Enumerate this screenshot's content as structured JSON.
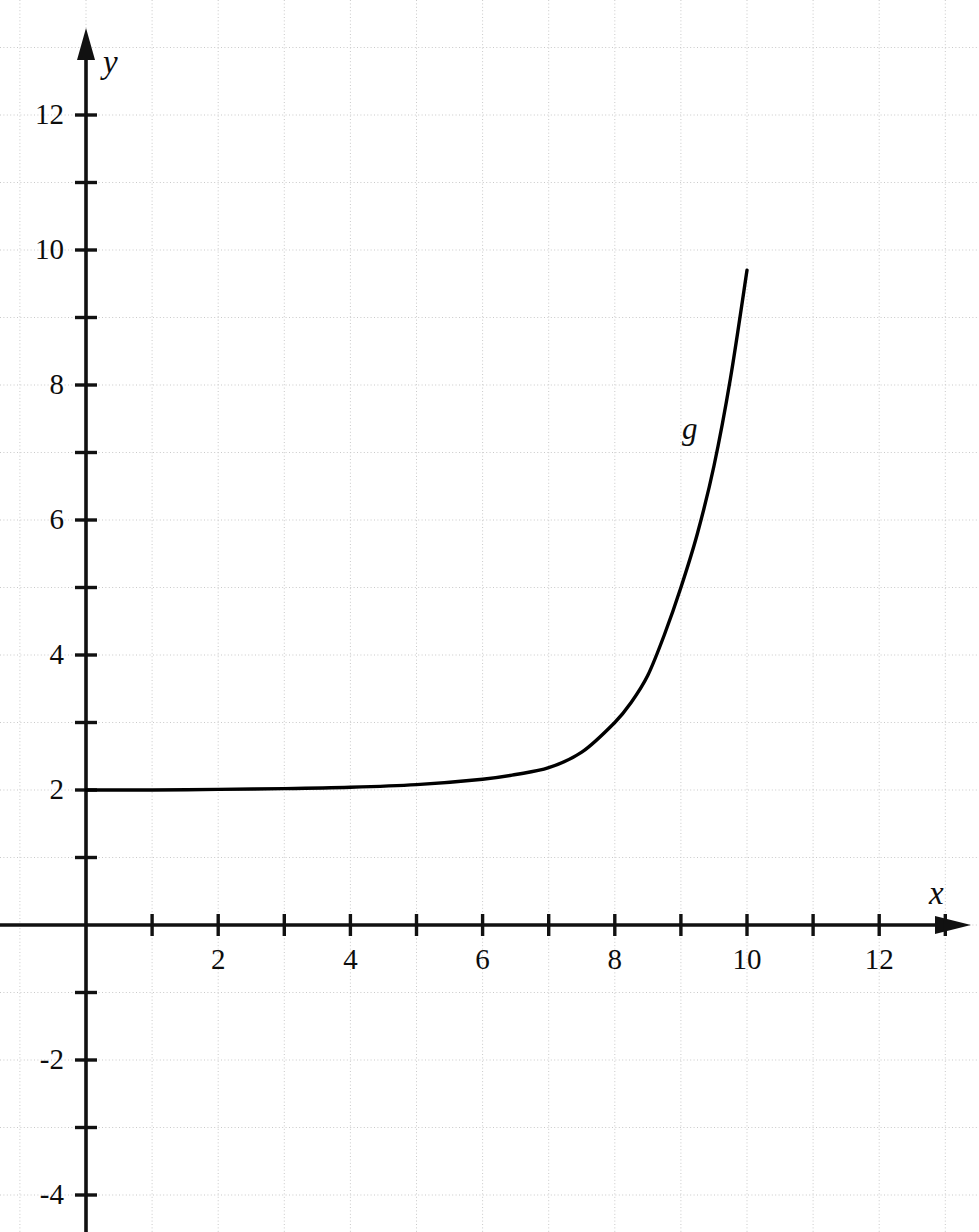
{
  "figure": {
    "background_color": "#ffffff",
    "width": 979,
    "height": 1232
  },
  "axes": {
    "x_axis_label": "x",
    "y_axis_label": "y",
    "axis_color": "#111111",
    "grid_color": "#c9c9c9",
    "grid_visible": true,
    "grid_step": 1,
    "origin_px": {
      "x": 86,
      "y": 925
    },
    "px_per_unit": {
      "x": 66.1,
      "y": 67.5
    },
    "x_tick_labels": [
      "2",
      "4",
      "6",
      "8",
      "10",
      "12"
    ],
    "x_tick_values": [
      2,
      4,
      6,
      8,
      10,
      12
    ],
    "x_minor_ticks": [
      1,
      3,
      5,
      7,
      9,
      11,
      13
    ],
    "y_tick_labels": [
      "12",
      "10",
      "8",
      "6",
      "4",
      "2",
      "-2",
      "-4"
    ],
    "y_tick_values": [
      12,
      10,
      8,
      6,
      4,
      2,
      -2,
      -4
    ],
    "y_minor_ticks": [
      11,
      9,
      7,
      5,
      3,
      1,
      -1,
      -3
    ],
    "xlim": [
      0,
      13.5
    ],
    "ylim": [
      -4,
      12.8
    ]
  },
  "chart_data": {
    "type": "line",
    "title": "",
    "subtitle": "",
    "xlabel": "x",
    "ylabel": "y",
    "xlim": [
      0,
      13.5
    ],
    "ylim": [
      -4,
      12.8
    ],
    "grid": true,
    "legend": "none",
    "annotations": [
      {
        "text": "g",
        "x": 9.2,
        "y": 7.35
      }
    ],
    "series": [
      {
        "name": "g",
        "label": "g",
        "color": "#000000",
        "line_width": 3,
        "asymptote": 2,
        "domain": [
          0,
          10
        ],
        "x": [
          0,
          1,
          2,
          3,
          4,
          5,
          6,
          6.5,
          7,
          7.5,
          8,
          8.25,
          8.5,
          8.75,
          9,
          9.25,
          9.5,
          9.75,
          10
        ],
        "values": [
          2.0,
          2.0,
          2.01,
          2.02,
          2.04,
          2.08,
          2.16,
          2.23,
          2.33,
          2.56,
          3.0,
          3.3,
          3.7,
          4.3,
          5.0,
          5.8,
          6.8,
          8.1,
          9.7
        ]
      }
    ]
  },
  "labels": {
    "x_axis": "x",
    "y_axis": "y",
    "curve": "g"
  }
}
